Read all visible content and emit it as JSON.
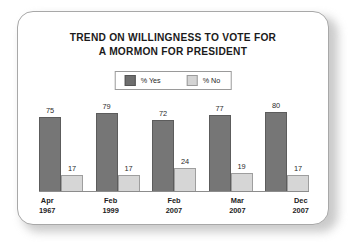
{
  "chart_data": {
    "type": "bar",
    "title": "TREND ON WILLINGNESS TO VOTE FOR A MORMON FOR PRESIDENT",
    "title_lines": [
      "TREND ON WILLINGNESS TO VOTE FOR",
      "A MORMON FOR PRESIDENT"
    ],
    "categories": [
      "Apr 1967",
      "Feb 1999",
      "Feb 2007",
      "Mar 2007",
      "Dec 2007"
    ],
    "category_lines": [
      {
        "month": "Apr",
        "year": "1967"
      },
      {
        "month": "Feb",
        "year": "1999"
      },
      {
        "month": "Feb",
        "year": "2007"
      },
      {
        "month": "Mar",
        "year": "2007"
      },
      {
        "month": "Dec",
        "year": "2007"
      }
    ],
    "series": [
      {
        "name": "% Yes",
        "color": "#767676",
        "values": [
          75,
          79,
          72,
          77,
          80
        ]
      },
      {
        "name": "% No",
        "color": "#d6d6d6",
        "values": [
          17,
          17,
          24,
          19,
          17
        ]
      }
    ],
    "xlabel": "",
    "ylabel": "",
    "ylim": [
      0,
      100
    ],
    "grid": false,
    "legend_position": "top-center",
    "axis_visible": "x-baseline-only"
  },
  "legend": {
    "items": [
      {
        "label": "% Yes",
        "swatch": "yes"
      },
      {
        "label": "% No",
        "swatch": "no"
      }
    ]
  }
}
